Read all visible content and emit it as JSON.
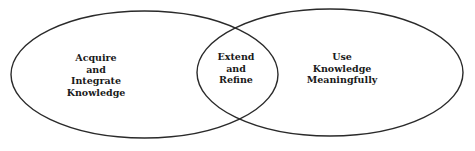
{
  "diagram": {
    "type": "venn",
    "circles": [
      {
        "id": "left",
        "lines": [
          "Acquire",
          "and",
          "Integrate",
          "Knowledge"
        ]
      },
      {
        "id": "right",
        "lines": [
          "Use",
          "Knowledge",
          "Meaningfully"
        ]
      }
    ],
    "overlap": {
      "lines": [
        "Extend",
        "and",
        "Refine"
      ]
    },
    "stroke_color": "#2a2a2a",
    "background": "#ffffff"
  }
}
